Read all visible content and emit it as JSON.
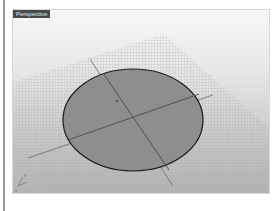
{
  "viewport": {
    "label": "Perspective",
    "background_top": "#f7f7f7",
    "background_bottom": "#b3b3b3"
  },
  "scene": {
    "object": "circle-surface",
    "fill_color": "#8e8e8e",
    "edge_color": "#1a1a1a",
    "grid_color": "#9c9c9c",
    "axis_color": "#555555"
  },
  "axes_widget": {
    "x_label": "x",
    "y_label": "y"
  }
}
